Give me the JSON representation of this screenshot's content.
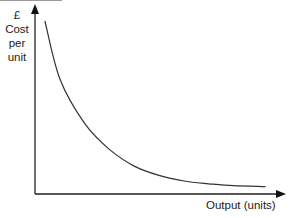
{
  "chart_data": {
    "type": "line",
    "title": "",
    "xlabel": "Output (units)",
    "ylabel": "£ Cost per unit",
    "ylabel_lines": [
      "£",
      "Cost",
      "per",
      "unit"
    ],
    "x_ticks": [],
    "y_ticks": [],
    "grid": false,
    "legend": null,
    "series": [
      {
        "name": "Average cost per unit",
        "description": "Downward-sloping curve, steep at low output and flattening as output increases (economies of scale)",
        "x": [
          0.04,
          0.1,
          0.2,
          0.3,
          0.4,
          0.5,
          0.6,
          0.7,
          0.8,
          0.93
        ],
        "y": [
          0.93,
          0.62,
          0.38,
          0.24,
          0.15,
          0.1,
          0.07,
          0.055,
          0.045,
          0.04
        ]
      }
    ],
    "xlim": [
      0,
      1
    ],
    "ylim": [
      0,
      1
    ]
  },
  "labels": {
    "y_axis": [
      "£",
      "Cost",
      "per",
      "unit"
    ],
    "x_axis": "Output (units)"
  }
}
